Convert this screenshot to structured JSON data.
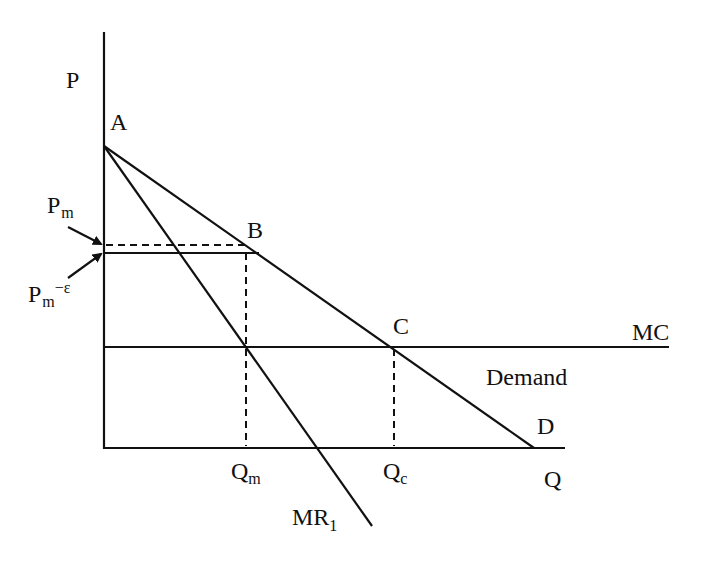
{
  "diagram": {
    "type": "economics-monopoly-limit-pricing",
    "colors": {
      "ink": "#111111",
      "background": "#ffffff"
    },
    "axes": {
      "y_label": "P",
      "x_label": "Q"
    },
    "points": {
      "A": "A",
      "B": "B",
      "C": "C",
      "D": "D"
    },
    "curves": {
      "marginal_cost": "MC",
      "demand": "Demand",
      "marginal_revenue": {
        "base": "MR",
        "sub": "1"
      }
    },
    "price_labels": {
      "monopoly_price": {
        "base": "P",
        "sub": "m"
      },
      "limit_price": {
        "base": "P",
        "sub": "m",
        "suffix": "−ε"
      }
    },
    "quantity_labels": {
      "monopoly_quantity": {
        "base": "Q",
        "sub": "m"
      },
      "competitive_quantity": {
        "base": "Q",
        "sub": "c"
      }
    }
  }
}
